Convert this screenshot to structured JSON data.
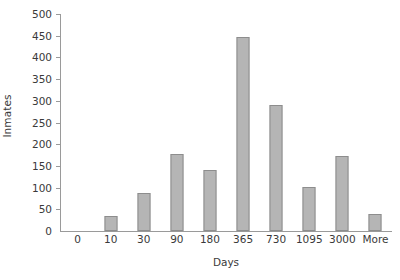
{
  "chart_data": {
    "type": "bar",
    "title": "",
    "subtitle": "",
    "xlabel": "Days",
    "ylabel": "Inmates",
    "categories": [
      "0",
      "10",
      "30",
      "90",
      "180",
      "365",
      "730",
      "1095",
      "3000",
      "More"
    ],
    "values": [
      0,
      35,
      88,
      178,
      140,
      448,
      290,
      102,
      172,
      40
    ],
    "ylim": [
      0,
      500
    ],
    "ytick_values": [
      0,
      50,
      100,
      150,
      200,
      250,
      300,
      350,
      400,
      450,
      500
    ],
    "ytick_labels": [
      "0",
      "50",
      "100",
      "150",
      "200",
      "250",
      "300",
      "350",
      "400",
      "450",
      "500"
    ],
    "grid": false,
    "legend": false,
    "legend_position": "none",
    "series": [
      {
        "name": "Inmates",
        "values": [
          0,
          35,
          88,
          178,
          140,
          448,
          290,
          102,
          172,
          40
        ]
      }
    ],
    "colors": {
      "bar_fill": "#b5b5b5",
      "bar_border": "#8d8d8d",
      "axis_line": "#9a9a9a",
      "text": "#3a3a3a",
      "background": "#ffffff"
    }
  }
}
